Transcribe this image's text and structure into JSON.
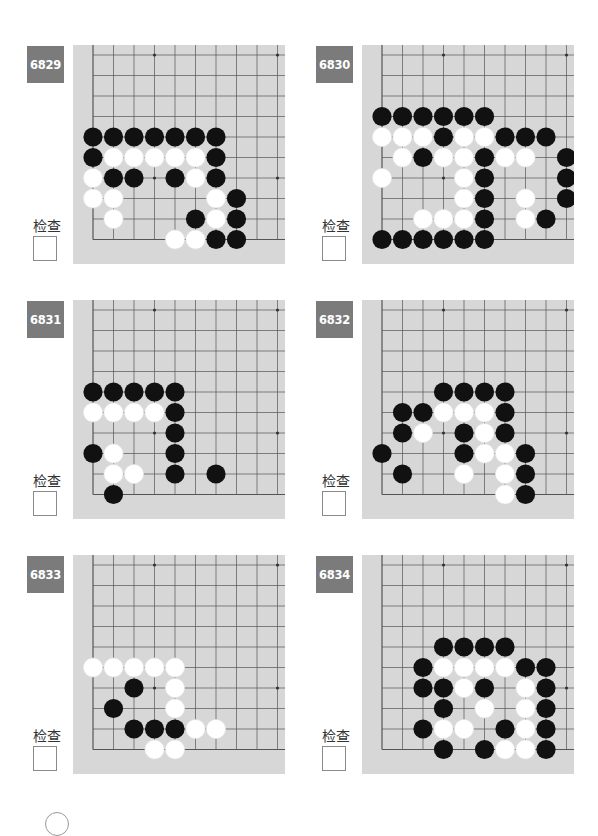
{
  "page": {
    "check_label": "检查"
  },
  "colors": {
    "label_bg": "#7b7b7b",
    "board_bg": "#d7d7d7",
    "grid_line": "#555555",
    "black_stone": "#111111",
    "white_stone": "#ffffff"
  },
  "board_spec": {
    "grid_origin_x": 20,
    "grid_origin_y": 10,
    "spacing": 20.5,
    "visible_cols": 11,
    "visible_rows": 10,
    "edges": [
      "left",
      "bottom"
    ],
    "star_points": [
      [
        3,
        0
      ],
      [
        9,
        0
      ],
      [
        3,
        6
      ],
      [
        9,
        6
      ]
    ]
  },
  "problems": [
    {
      "number": "6829",
      "check_label": "检查",
      "stones": {
        "black": [
          [
            0,
            4
          ],
          [
            1,
            4
          ],
          [
            2,
            4
          ],
          [
            3,
            4
          ],
          [
            4,
            4
          ],
          [
            5,
            4
          ],
          [
            6,
            4
          ],
          [
            0,
            5
          ],
          [
            6,
            5
          ],
          [
            1,
            6
          ],
          [
            2,
            6
          ],
          [
            4,
            6
          ],
          [
            6,
            6
          ],
          [
            7,
            7
          ],
          [
            5,
            8
          ],
          [
            7,
            8
          ],
          [
            6,
            9
          ],
          [
            7,
            9
          ]
        ],
        "white": [
          [
            1,
            5
          ],
          [
            2,
            5
          ],
          [
            3,
            5
          ],
          [
            4,
            5
          ],
          [
            5,
            5
          ],
          [
            0,
            6
          ],
          [
            5,
            6
          ],
          [
            0,
            7
          ],
          [
            1,
            7
          ],
          [
            6,
            7
          ],
          [
            1,
            8
          ],
          [
            6,
            8
          ],
          [
            4,
            9
          ],
          [
            5,
            9
          ]
        ]
      }
    },
    {
      "number": "6830",
      "check_label": "检查",
      "stones": {
        "black": [
          [
            0,
            3
          ],
          [
            1,
            3
          ],
          [
            2,
            3
          ],
          [
            3,
            3
          ],
          [
            4,
            3
          ],
          [
            5,
            3
          ],
          [
            3,
            4
          ],
          [
            6,
            4
          ],
          [
            7,
            4
          ],
          [
            8,
            4
          ],
          [
            2,
            5
          ],
          [
            5,
            5
          ],
          [
            9,
            5
          ],
          [
            5,
            6
          ],
          [
            9,
            6
          ],
          [
            5,
            7
          ],
          [
            9,
            7
          ],
          [
            5,
            8
          ],
          [
            8,
            8
          ],
          [
            0,
            9
          ],
          [
            1,
            9
          ],
          [
            2,
            9
          ],
          [
            3,
            9
          ],
          [
            4,
            9
          ],
          [
            5,
            9
          ]
        ],
        "white": [
          [
            0,
            4
          ],
          [
            1,
            4
          ],
          [
            2,
            4
          ],
          [
            4,
            4
          ],
          [
            5,
            4
          ],
          [
            1,
            5
          ],
          [
            3,
            5
          ],
          [
            4,
            5
          ],
          [
            6,
            5
          ],
          [
            7,
            5
          ],
          [
            0,
            6
          ],
          [
            4,
            6
          ],
          [
            4,
            7
          ],
          [
            7,
            7
          ],
          [
            2,
            8
          ],
          [
            3,
            8
          ],
          [
            4,
            8
          ],
          [
            7,
            8
          ]
        ]
      }
    },
    {
      "number": "6831",
      "check_label": "检查",
      "stones": {
        "black": [
          [
            0,
            4
          ],
          [
            1,
            4
          ],
          [
            2,
            4
          ],
          [
            3,
            4
          ],
          [
            4,
            4
          ],
          [
            4,
            5
          ],
          [
            4,
            6
          ],
          [
            0,
            7
          ],
          [
            4,
            7
          ],
          [
            4,
            8
          ],
          [
            6,
            8
          ],
          [
            1,
            9
          ]
        ],
        "white": [
          [
            0,
            5
          ],
          [
            1,
            5
          ],
          [
            2,
            5
          ],
          [
            3,
            5
          ],
          [
            1,
            7
          ],
          [
            1,
            8
          ],
          [
            2,
            8
          ]
        ]
      }
    },
    {
      "number": "6832",
      "check_label": "检查",
      "stones": {
        "black": [
          [
            3,
            4
          ],
          [
            4,
            4
          ],
          [
            5,
            4
          ],
          [
            6,
            4
          ],
          [
            1,
            5
          ],
          [
            2,
            5
          ],
          [
            6,
            5
          ],
          [
            1,
            6
          ],
          [
            4,
            6
          ],
          [
            6,
            6
          ],
          [
            0,
            7
          ],
          [
            4,
            7
          ],
          [
            7,
            7
          ],
          [
            1,
            8
          ],
          [
            7,
            8
          ],
          [
            7,
            9
          ]
        ],
        "white": [
          [
            3,
            5
          ],
          [
            4,
            5
          ],
          [
            5,
            5
          ],
          [
            2,
            6
          ],
          [
            5,
            6
          ],
          [
            5,
            7
          ],
          [
            6,
            7
          ],
          [
            4,
            8
          ],
          [
            6,
            8
          ],
          [
            6,
            9
          ]
        ]
      }
    },
    {
      "number": "6833",
      "check_label": "检查",
      "stones": {
        "black": [
          [
            2,
            6
          ],
          [
            1,
            7
          ],
          [
            2,
            8
          ],
          [
            3,
            8
          ],
          [
            4,
            8
          ]
        ],
        "white": [
          [
            0,
            5
          ],
          [
            1,
            5
          ],
          [
            2,
            5
          ],
          [
            3,
            5
          ],
          [
            4,
            5
          ],
          [
            4,
            6
          ],
          [
            4,
            7
          ],
          [
            5,
            8
          ],
          [
            6,
            8
          ],
          [
            3,
            9
          ],
          [
            4,
            9
          ]
        ]
      }
    },
    {
      "number": "6834",
      "check_label": "检查",
      "stones": {
        "black": [
          [
            3,
            4
          ],
          [
            4,
            4
          ],
          [
            5,
            4
          ],
          [
            6,
            4
          ],
          [
            2,
            5
          ],
          [
            7,
            5
          ],
          [
            8,
            5
          ],
          [
            2,
            6
          ],
          [
            3,
            6
          ],
          [
            5,
            6
          ],
          [
            8,
            6
          ],
          [
            3,
            7
          ],
          [
            8,
            7
          ],
          [
            2,
            8
          ],
          [
            6,
            8
          ],
          [
            8,
            8
          ],
          [
            3,
            9
          ],
          [
            5,
            9
          ],
          [
            8,
            9
          ]
        ],
        "white": [
          [
            3,
            5
          ],
          [
            4,
            5
          ],
          [
            5,
            5
          ],
          [
            6,
            5
          ],
          [
            4,
            6
          ],
          [
            7,
            6
          ],
          [
            5,
            7
          ],
          [
            7,
            7
          ],
          [
            3,
            8
          ],
          [
            4,
            8
          ],
          [
            7,
            8
          ],
          [
            6,
            9
          ],
          [
            7,
            9
          ]
        ]
      }
    }
  ]
}
